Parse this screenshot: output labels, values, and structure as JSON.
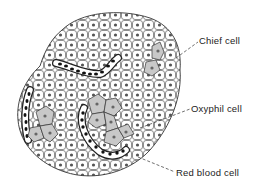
{
  "figure": {
    "labels": [
      {
        "id": "chief",
        "text": "Chief cell"
      },
      {
        "id": "oxyphil",
        "text": "Oxyphil cell"
      },
      {
        "id": "rbc",
        "text": "Red blood cell"
      }
    ]
  },
  "colors": {
    "outline": "#333333",
    "chief_fill": "#ffffff",
    "oxyphil_fill": "#c8c8c8",
    "nucleus": "#666666",
    "rbc": "#1a1a1a"
  }
}
